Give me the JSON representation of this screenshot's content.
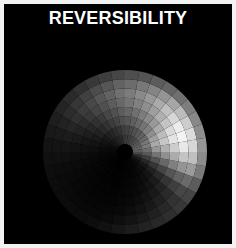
{
  "figure": {
    "width": 236,
    "height": 248,
    "background_color": "#f2f2f2",
    "border_color": "#f2f2f2"
  },
  "plot": {
    "title": "REVERSIBILITY",
    "title_color": "#ffffff",
    "canvas_color": "#000000",
    "canvas": {
      "x": 4,
      "y": 4,
      "width": 228,
      "height": 240
    }
  },
  "chart_data": {
    "type": "heatmap",
    "projection": "polar",
    "title": "REVERSIBILITY",
    "subtitle": "",
    "xlabel": "",
    "ylabel": "",
    "grid": false,
    "legend": false,
    "colormap": "gray",
    "value_range": [
      0,
      255
    ],
    "center": {
      "x": 121,
      "y": 148
    },
    "inner_radius": 8,
    "outer_radius": 82,
    "n_sectors": 36,
    "n_rings": 8,
    "theta_start_deg": 0,
    "theta_step_deg": 10,
    "theta_direction": "counterclockwise",
    "theta_zero_location": "E",
    "ring_labels": [
      "r1",
      "r2",
      "r3",
      "r4",
      "r5",
      "r6",
      "r7",
      "r8"
    ],
    "sector_labels": [
      "0",
      "10",
      "20",
      "30",
      "40",
      "50",
      "60",
      "70",
      "80",
      "90",
      "100",
      "110",
      "120",
      "130",
      "140",
      "150",
      "160",
      "170",
      "180",
      "190",
      "200",
      "210",
      "220",
      "230",
      "240",
      "250",
      "260",
      "270",
      "280",
      "290",
      "300",
      "310",
      "320",
      "330",
      "340",
      "350"
    ],
    "values": [
      [
        92,
        108,
        150,
        176,
        205,
        232,
        215,
        150
      ],
      [
        100,
        122,
        168,
        198,
        228,
        243,
        220,
        142
      ],
      [
        96,
        118,
        160,
        188,
        218,
        236,
        205,
        136
      ],
      [
        88,
        104,
        142,
        170,
        196,
        214,
        188,
        126
      ],
      [
        80,
        96,
        128,
        152,
        176,
        192,
        166,
        112
      ],
      [
        74,
        88,
        116,
        138,
        158,
        170,
        148,
        100
      ],
      [
        68,
        80,
        104,
        124,
        142,
        152,
        132,
        92
      ],
      [
        62,
        72,
        94,
        112,
        128,
        138,
        120,
        84
      ],
      [
        56,
        66,
        86,
        102,
        116,
        124,
        108,
        78
      ],
      [
        50,
        60,
        78,
        92,
        104,
        112,
        98,
        70
      ],
      [
        44,
        52,
        68,
        80,
        92,
        98,
        86,
        62
      ],
      [
        38,
        46,
        60,
        70,
        80,
        86,
        76,
        56
      ],
      [
        32,
        38,
        50,
        58,
        68,
        72,
        64,
        48
      ],
      [
        26,
        32,
        42,
        48,
        56,
        60,
        54,
        42
      ],
      [
        20,
        25,
        33,
        38,
        44,
        48,
        44,
        36
      ],
      [
        15,
        19,
        25,
        29,
        34,
        37,
        34,
        30
      ],
      [
        11,
        14,
        19,
        22,
        26,
        28,
        26,
        24
      ],
      [
        8,
        10,
        14,
        16,
        19,
        21,
        20,
        19
      ],
      [
        6,
        8,
        10,
        12,
        14,
        16,
        16,
        16
      ],
      [
        5,
        6,
        8,
        9,
        11,
        12,
        13,
        14
      ],
      [
        4,
        5,
        6,
        7,
        9,
        10,
        11,
        13
      ],
      [
        3,
        4,
        5,
        6,
        7,
        8,
        10,
        12
      ],
      [
        3,
        3,
        4,
        5,
        6,
        7,
        9,
        12
      ],
      [
        2,
        3,
        4,
        4,
        5,
        6,
        8,
        11
      ],
      [
        2,
        2,
        3,
        4,
        5,
        6,
        8,
        13
      ],
      [
        2,
        2,
        3,
        4,
        5,
        7,
        10,
        17
      ],
      [
        2,
        3,
        4,
        5,
        7,
        9,
        14,
        22
      ],
      [
        3,
        4,
        5,
        7,
        9,
        13,
        19,
        28
      ],
      [
        4,
        5,
        7,
        9,
        13,
        18,
        25,
        34
      ],
      [
        5,
        7,
        10,
        13,
        18,
        24,
        32,
        40
      ],
      [
        7,
        10,
        14,
        19,
        25,
        32,
        40,
        46
      ],
      [
        10,
        14,
        20,
        27,
        34,
        42,
        50,
        54
      ],
      [
        16,
        22,
        31,
        41,
        52,
        62,
        70,
        68
      ],
      [
        28,
        38,
        52,
        68,
        84,
        98,
        106,
        92
      ],
      [
        48,
        62,
        82,
        104,
        128,
        148,
        155,
        122
      ],
      [
        72,
        88,
        116,
        144,
        172,
        196,
        192,
        140
      ]
    ]
  }
}
